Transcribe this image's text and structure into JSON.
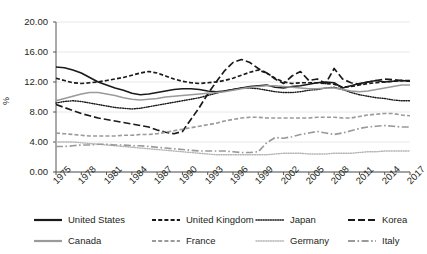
{
  "chart_data": {
    "type": "line",
    "title": "",
    "xlabel": "",
    "ylabel": "%",
    "ylim": [
      0,
      20
    ],
    "ytick_labels": [
      "0.00",
      "4.00",
      "8.00",
      "12.00",
      "16.00",
      "20.00"
    ],
    "ytick_values": [
      0,
      4,
      8,
      12,
      16,
      20
    ],
    "xlim": [
      1975,
      2017
    ],
    "xtick_labels": [
      "1975",
      "1978",
      "1981",
      "1984",
      "1987",
      "1990",
      "1993",
      "1996",
      "1999",
      "2002",
      "2005",
      "2008",
      "2011",
      "2014",
      "2017"
    ],
    "xtick_values": [
      1975,
      1978,
      1981,
      1984,
      1987,
      1990,
      1993,
      1996,
      1999,
      2002,
      2005,
      2008,
      2011,
      2014,
      2017
    ],
    "grid": "horizontal",
    "legend_position": "bottom",
    "x": [
      1975,
      1976,
      1977,
      1978,
      1979,
      1980,
      1981,
      1982,
      1983,
      1984,
      1985,
      1986,
      1987,
      1988,
      1989,
      1990,
      1991,
      1992,
      1993,
      1994,
      1995,
      1996,
      1997,
      1998,
      1999,
      2000,
      2001,
      2002,
      2003,
      2004,
      2005,
      2006,
      2007,
      2008,
      2009,
      2010,
      2011,
      2012,
      2013,
      2014,
      2015,
      2016,
      2017
    ],
    "series": [
      {
        "name": "United States",
        "style": "solid",
        "color": "#1a1a1a",
        "values": [
          14.0,
          13.9,
          13.6,
          13.2,
          12.6,
          12.0,
          11.6,
          11.2,
          10.9,
          10.5,
          10.3,
          10.4,
          10.6,
          10.8,
          11.0,
          11.1,
          11.1,
          11.0,
          10.8,
          10.7,
          10.8,
          11.0,
          11.2,
          11.4,
          11.5,
          11.6,
          11.3,
          11.2,
          11.4,
          11.5,
          11.7,
          11.9,
          12.0,
          11.9,
          11.2,
          11.5,
          11.8,
          12.0,
          12.2,
          12.0,
          12.1,
          12.2,
          12.1
        ]
      },
      {
        "name": "United Kingdom",
        "style": "dashed",
        "color": "#1a1a1a",
        "values": [
          12.5,
          12.2,
          11.9,
          11.8,
          11.9,
          12.0,
          12.2,
          12.4,
          12.6,
          12.9,
          13.2,
          13.4,
          13.2,
          12.8,
          12.4,
          12.1,
          11.9,
          11.8,
          11.9,
          12.0,
          12.2,
          12.5,
          12.9,
          13.3,
          13.6,
          13.2,
          12.5,
          12.0,
          11.8,
          11.9,
          11.9,
          11.9,
          11.8,
          11.7,
          11.3,
          11.4,
          11.6,
          11.8,
          11.9,
          12.0,
          12.1,
          12.2,
          12.1
        ]
      },
      {
        "name": "Japan",
        "style": "dotted",
        "color": "#1a1a1a",
        "values": [
          9.2,
          9.4,
          9.5,
          9.4,
          9.2,
          9.0,
          8.8,
          8.6,
          8.5,
          8.4,
          8.5,
          8.7,
          8.9,
          9.1,
          9.3,
          9.5,
          9.7,
          9.9,
          10.2,
          10.5,
          10.8,
          11.0,
          11.2,
          11.2,
          11.1,
          10.9,
          10.7,
          10.6,
          10.6,
          10.7,
          10.9,
          11.0,
          11.2,
          11.3,
          11.0,
          10.6,
          10.3,
          10.1,
          9.9,
          9.8,
          9.6,
          9.5,
          9.5
        ]
      },
      {
        "name": "Korea",
        "style": "longdash",
        "color": "#1a1a1a",
        "values": [
          9.0,
          8.6,
          8.2,
          7.8,
          7.5,
          7.2,
          7.0,
          6.8,
          6.6,
          6.4,
          6.2,
          6.0,
          5.6,
          5.3,
          5.1,
          5.4,
          7.0,
          8.6,
          10.4,
          12.0,
          13.5,
          14.6,
          15.0,
          14.6,
          13.8,
          13.2,
          12.4,
          11.8,
          12.8,
          13.4,
          12.2,
          12.4,
          11.8,
          13.8,
          12.4,
          11.9,
          11.7,
          12.0,
          12.2,
          12.4,
          12.3,
          12.2,
          12.2
        ]
      },
      {
        "name": "Canada",
        "style": "solid",
        "color": "#9a9a9a",
        "values": [
          9.5,
          9.8,
          10.1,
          10.4,
          10.6,
          10.6,
          10.4,
          10.2,
          9.9,
          9.7,
          9.6,
          9.7,
          9.8,
          10.0,
          10.1,
          10.2,
          10.3,
          10.4,
          10.5,
          10.6,
          10.7,
          10.9,
          11.1,
          11.3,
          11.4,
          11.5,
          11.5,
          11.4,
          11.3,
          11.2,
          11.1,
          11.1,
          11.2,
          11.2,
          11.0,
          10.8,
          10.7,
          10.8,
          11.0,
          11.2,
          11.4,
          11.6,
          11.6
        ]
      },
      {
        "name": "France",
        "style": "dashed",
        "color": "#9a9a9a",
        "values": [
          5.2,
          5.1,
          5.0,
          4.9,
          4.8,
          4.8,
          4.8,
          4.8,
          4.9,
          4.9,
          5.0,
          5.0,
          5.1,
          5.3,
          5.5,
          5.7,
          5.9,
          6.1,
          6.3,
          6.5,
          6.8,
          7.0,
          7.2,
          7.3,
          7.3,
          7.2,
          7.2,
          7.2,
          7.2,
          7.2,
          7.2,
          7.3,
          7.3,
          7.3,
          7.2,
          7.2,
          7.4,
          7.6,
          7.7,
          7.8,
          7.8,
          7.6,
          7.5
        ]
      },
      {
        "name": "Germany",
        "style": "dotted",
        "color": "#b5b5b5",
        "values": [
          4.0,
          4.0,
          4.0,
          3.9,
          3.8,
          3.7,
          3.6,
          3.5,
          3.4,
          3.3,
          3.2,
          3.1,
          3.0,
          2.9,
          2.8,
          2.7,
          2.6,
          2.5,
          2.4,
          2.3,
          2.3,
          2.3,
          2.3,
          2.3,
          2.3,
          2.3,
          2.4,
          2.5,
          2.5,
          2.5,
          2.4,
          2.4,
          2.4,
          2.5,
          2.5,
          2.5,
          2.6,
          2.7,
          2.7,
          2.8,
          2.8,
          2.8,
          2.8
        ]
      },
      {
        "name": "Italy",
        "style": "dashdot",
        "color": "#9a9a9a",
        "values": [
          3.4,
          3.4,
          3.5,
          3.6,
          3.6,
          3.7,
          3.7,
          3.6,
          3.6,
          3.5,
          3.5,
          3.4,
          3.3,
          3.2,
          3.1,
          3.0,
          2.9,
          2.8,
          2.8,
          2.8,
          2.8,
          2.7,
          2.6,
          2.6,
          2.7,
          3.9,
          4.6,
          4.5,
          4.7,
          5.0,
          5.2,
          5.4,
          5.2,
          5.0,
          5.2,
          5.5,
          5.8,
          6.0,
          6.1,
          6.2,
          6.1,
          6.0,
          6.0
        ]
      }
    ]
  },
  "legend": {
    "items": [
      {
        "label": "United States",
        "style": "solid",
        "color": "#1a1a1a"
      },
      {
        "label": "United Kingdom",
        "style": "dashed",
        "color": "#1a1a1a"
      },
      {
        "label": "Japan",
        "style": "dotted",
        "color": "#1a1a1a"
      },
      {
        "label": "Korea",
        "style": "longdash",
        "color": "#1a1a1a"
      },
      {
        "label": "Canada",
        "style": "solid",
        "color": "#9a9a9a"
      },
      {
        "label": "France",
        "style": "dashed",
        "color": "#9a9a9a"
      },
      {
        "label": "Germany",
        "style": "dotted",
        "color": "#b5b5b5"
      },
      {
        "label": "Italy",
        "style": "dashdot",
        "color": "#9a9a9a"
      }
    ]
  }
}
